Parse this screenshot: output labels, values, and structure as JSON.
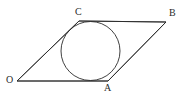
{
  "figure": {
    "kind": "geometry-diagram",
    "background_color": "#ffffff",
    "stroke_color": "#2b2b2b",
    "stroke_width": 0.9,
    "canvas": {
      "width": 182,
      "height": 99
    },
    "vertices": [
      {
        "name": "O",
        "label": "O",
        "x": 17,
        "y": 81,
        "label_x": 6,
        "label_y": 75
      },
      {
        "name": "C",
        "label": "C",
        "x": 79,
        "y": 21,
        "label_x": 75,
        "label_y": 7
      },
      {
        "name": "B",
        "label": "B",
        "x": 166,
        "y": 22,
        "label_x": 169,
        "label_y": 8
      },
      {
        "name": "A",
        "label": "A",
        "x": 108,
        "y": 81,
        "label_x": 104,
        "label_y": 83
      }
    ],
    "edges": [
      {
        "name": "side-OC",
        "from": "O",
        "to": "C"
      },
      {
        "name": "side-CB",
        "from": "C",
        "to": "B"
      },
      {
        "name": "side-BA",
        "from": "B",
        "to": "A"
      },
      {
        "name": "side-AO",
        "from": "A",
        "to": "O"
      }
    ],
    "circle": {
      "name": "inscribed-circle",
      "center_x": 90.5,
      "center_y": 51,
      "radius": 29.5,
      "fill": "none"
    },
    "polygon_points": "17,81 79,21 166,22 108,81"
  }
}
